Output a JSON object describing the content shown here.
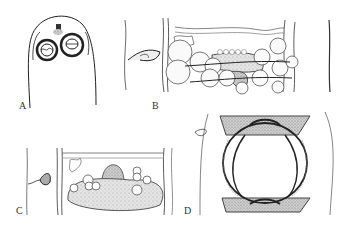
{
  "figure": {
    "panels": [
      {
        "id": "A",
        "label": "A",
        "description": "anterior end with two suckers"
      },
      {
        "id": "B",
        "label": "B",
        "description": "segment with gonads and ovary"
      },
      {
        "id": "C",
        "label": "C",
        "description": "segment with vitellaria and central mass"
      },
      {
        "id": "D",
        "label": "D",
        "description": "segment with large central organ"
      }
    ]
  },
  "colors": {
    "ink": "#222222",
    "stipple": "#9a9a9a",
    "line_light": "#777777",
    "background": "#ffffff"
  }
}
